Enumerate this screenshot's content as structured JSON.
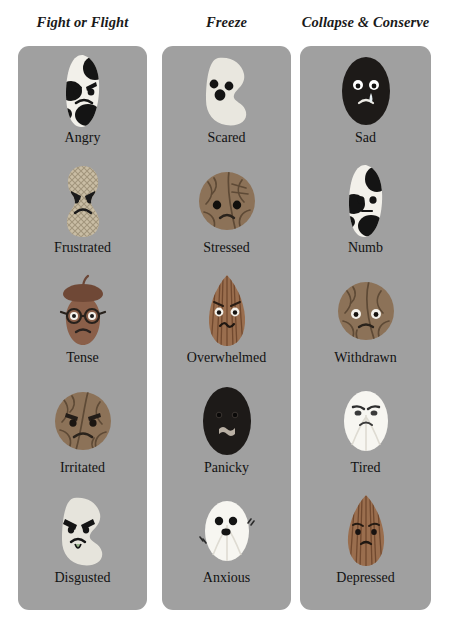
{
  "page": {
    "background_color": "#ffffff",
    "card_color": "#a0a0a0",
    "text_color": "#121212"
  },
  "columns": [
    {
      "id": "fight-or-flight",
      "header": "Fight or Flight",
      "items": [
        {
          "label": "Angry",
          "art": "spotted-bean",
          "colors": {
            "base": "#f2f0ea",
            "spot": "#141414"
          }
        },
        {
          "label": "Frustrated",
          "art": "peanut",
          "colors": {
            "base": "#c9bda4",
            "spot": "#6d6351"
          }
        },
        {
          "label": "Tense",
          "art": "acorn",
          "colors": {
            "base": "#8a5f49",
            "spot": "#6b4636"
          }
        },
        {
          "label": "Irritated",
          "art": "walnut",
          "colors": {
            "base": "#8c7258",
            "spot": "#5e4a36"
          }
        },
        {
          "label": "Disgusted",
          "art": "kidney-bean",
          "colors": {
            "base": "#e6e4dc",
            "spot": "#141414"
          }
        }
      ]
    },
    {
      "id": "freeze",
      "header": "Freeze",
      "items": [
        {
          "label": "Scared",
          "art": "kidney-bean",
          "colors": {
            "base": "#e9e7df",
            "spot": "#141414"
          }
        },
        {
          "label": "Stressed",
          "art": "walnut",
          "colors": {
            "base": "#8c7258",
            "spot": "#5e4a36"
          }
        },
        {
          "label": "Overwhelmed",
          "art": "almond",
          "colors": {
            "base": "#9a6e4e",
            "spot": "#6f4b32"
          }
        },
        {
          "label": "Panicky",
          "art": "black-bean",
          "colors": {
            "base": "#1d1a18",
            "spot": "#b9b0a4"
          }
        },
        {
          "label": "Anxious",
          "art": "white-bean",
          "colors": {
            "base": "#f7f6f1",
            "spot": "#141414"
          }
        }
      ]
    },
    {
      "id": "collapse-and-conserve",
      "header": "Collapse & Conserve",
      "items": [
        {
          "label": "Sad",
          "art": "black-bean",
          "colors": {
            "base": "#1d1a18",
            "spot": "#ffffff"
          }
        },
        {
          "label": "Numb",
          "art": "spotted-bean",
          "colors": {
            "base": "#f2f0ea",
            "spot": "#141414"
          }
        },
        {
          "label": "Withdrawn",
          "art": "walnut",
          "colors": {
            "base": "#8c7258",
            "spot": "#5e4a36"
          }
        },
        {
          "label": "Tired",
          "art": "white-bean",
          "colors": {
            "base": "#f7f6f1",
            "spot": "#141414"
          }
        },
        {
          "label": "Depressed",
          "art": "almond",
          "colors": {
            "base": "#9a6e4e",
            "spot": "#6f4b32"
          }
        }
      ]
    }
  ]
}
